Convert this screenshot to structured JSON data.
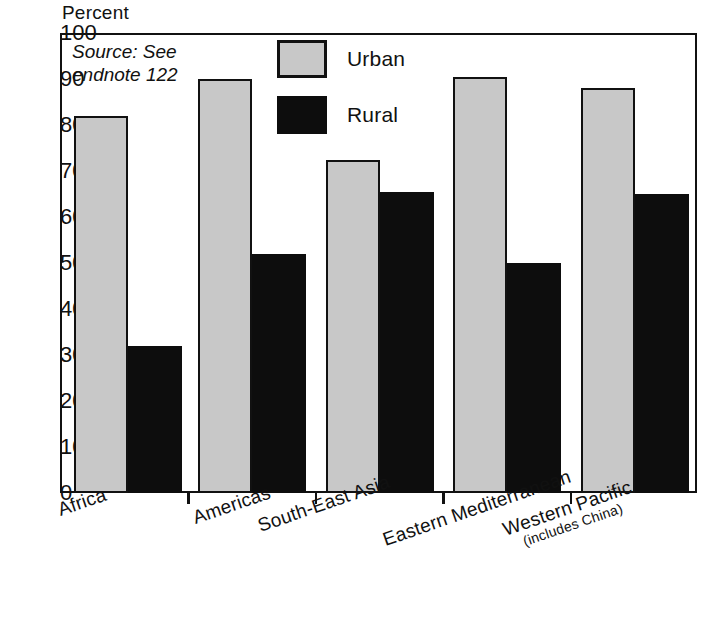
{
  "chart_data": {
    "type": "bar",
    "title": "",
    "subtitle": "",
    "xlabel": "",
    "ylabel": "Percent",
    "ylim": [
      0,
      100
    ],
    "ytick_step": 10,
    "yticks": [
      100,
      90,
      80,
      70,
      60,
      50,
      40,
      30,
      20,
      10,
      0
    ],
    "grid": false,
    "legend_position": "top-center",
    "categories": [
      "Africa",
      "Americas",
      "South-East Asia",
      "Eastern Mediterranean",
      "Western Pacific"
    ],
    "category_sublabels": [
      "",
      "",
      "",
      "",
      "(includes China)"
    ],
    "series": [
      {
        "name": "Urban",
        "color": "#c8c8c8",
        "values": [
          82,
          90,
          72.5,
          90.5,
          88
        ]
      },
      {
        "name": "Rural",
        "color": "#0d0d0d",
        "values": [
          32,
          52,
          65.5,
          50,
          65
        ]
      }
    ],
    "annotations": [
      "Source: See\nendnote 122"
    ]
  },
  "axis": {
    "y_title": "Percent"
  },
  "legend": {
    "items": [
      {
        "label": "Urban",
        "swatch": "gray-filled-square"
      },
      {
        "label": "Rural",
        "swatch": "black-filled-square"
      }
    ]
  },
  "source": {
    "text": "Source: See\nendnote 122"
  }
}
